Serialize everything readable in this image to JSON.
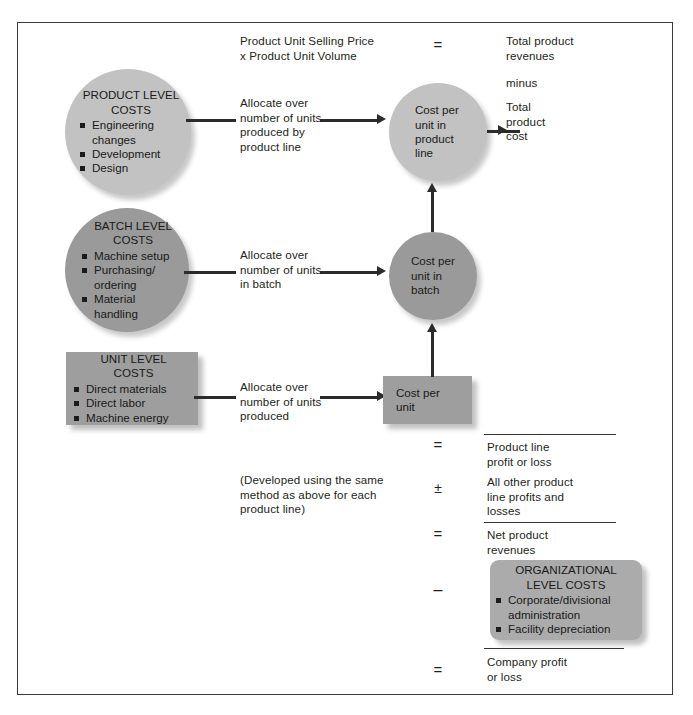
{
  "diagram": {
    "colors": {
      "product_level_fill": "#c2c2c2",
      "batch_level_fill": "#9a9a9a",
      "unit_level_fill": "#9e9e9e",
      "cost_per_unit_product_line_fill": "#c2c2c2",
      "cost_per_unit_batch_fill": "#9a9a9a",
      "cost_per_unit_fill": "#9e9e9e",
      "organizational_level_fill": "#ababab",
      "line": "#2b2b2b",
      "frame": "#3a3a3a",
      "text": "#231f20"
    }
  },
  "cost_pools": [
    {
      "id": "product-level-costs",
      "title": "PRODUCT LEVEL\nCOSTS",
      "items": [
        "Engineering\nchanges",
        "Development",
        "Design"
      ]
    },
    {
      "id": "batch-level-costs",
      "title": "BATCH LEVEL\nCOSTS",
      "items": [
        "Machine setup",
        "Purchasing/\nordering",
        "Material\nhandling"
      ]
    },
    {
      "id": "unit-level-costs",
      "title": "UNIT LEVEL\nCOSTS",
      "items": [
        "Direct materials",
        "Direct labor",
        "Machine energy"
      ]
    }
  ],
  "allocations": [
    {
      "id": "allocate-product-line",
      "text": "Allocate over\nnumber of units\nproduced by\nproduct line"
    },
    {
      "id": "allocate-batch",
      "text": "Allocate over\nnumber of units\nin batch"
    },
    {
      "id": "allocate-unit",
      "text": "Allocate over\nnumber of units\nproduced"
    }
  ],
  "cost_nodes": [
    {
      "id": "cost-per-unit-in-product-line",
      "label": "Cost per\nunit in\nproduct\nline"
    },
    {
      "id": "cost-per-unit-in-batch",
      "label": "Cost per\nunit in\nbatch"
    },
    {
      "id": "cost-per-unit",
      "label": "Cost per\nunit"
    }
  ],
  "revenue_formula": {
    "id": "revenue-formula",
    "text": "Product Unit Selling Price\nx Product Unit Volume"
  },
  "note": {
    "id": "developed-note",
    "text": "(Developed using the same\nmethod as above for each\nproduct line)"
  },
  "statement": {
    "lines": [
      {
        "id": "total-product-revenues",
        "text": "Total product\nrevenues"
      },
      {
        "id": "minus-word",
        "text": "minus"
      },
      {
        "id": "total-product-cost",
        "text": "Total\nproduct\ncost"
      },
      {
        "id": "product-line-profit-or-loss",
        "text": "Product line\nprofit or loss"
      },
      {
        "id": "all-other-product-line-profits-and-losses",
        "text": "All other product\nline profits and\nlosses"
      },
      {
        "id": "net-product-revenues",
        "text": "Net product\nrevenues"
      },
      {
        "id": "company-profit-or-loss",
        "text": "Company profit\nor loss"
      }
    ]
  },
  "operators": [
    {
      "id": "equals-top",
      "symbol": "="
    },
    {
      "id": "equals-product-line-profit",
      "symbol": "="
    },
    {
      "id": "plus-minus-other-lines",
      "symbol": "±"
    },
    {
      "id": "equals-net-product-revenues",
      "symbol": "="
    },
    {
      "id": "minus-organizational-costs",
      "symbol": "–"
    },
    {
      "id": "equals-company-profit",
      "symbol": "="
    }
  ],
  "organizational_costs": {
    "id": "organizational-level-costs",
    "title": "ORGANIZATIONAL\nLEVEL COSTS",
    "items": [
      "Corporate/divisional\nadministration",
      "Facility depreciation"
    ]
  }
}
